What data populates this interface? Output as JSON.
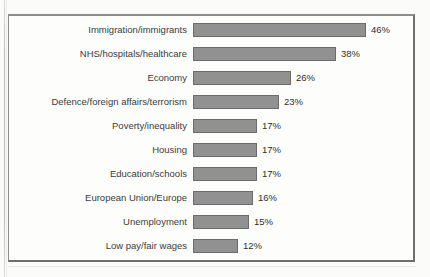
{
  "chart_data": {
    "type": "bar",
    "orientation": "horizontal",
    "title": "",
    "xlabel": "",
    "ylabel": "",
    "grid": false,
    "legend": null,
    "value_suffix": "%",
    "xlim": [
      0,
      46
    ],
    "categories": [
      "Immigration/immigrants",
      "NHS/hospitals/healthcare",
      "Economy",
      "Defence/foreign affairs/terrorism",
      "Poverty/inequality",
      "Housing",
      "Education/schools",
      "European Union/Europe",
      "Unemployment",
      "Low pay/fair wages"
    ],
    "values": [
      46,
      38,
      26,
      23,
      17,
      17,
      17,
      16,
      15,
      12
    ],
    "value_labels": [
      "46%",
      "38%",
      "26%",
      "23%",
      "17%",
      "17%",
      "17%",
      "16%",
      "15%",
      "12%"
    ],
    "bar_color": "#919191",
    "bar_border_color": "#6b6b6b",
    "frame_color": "#7d7d7b",
    "background_color": "#fdfdfc"
  },
  "page": {
    "background_color": "#fbfbfa",
    "title_remnant": ""
  }
}
